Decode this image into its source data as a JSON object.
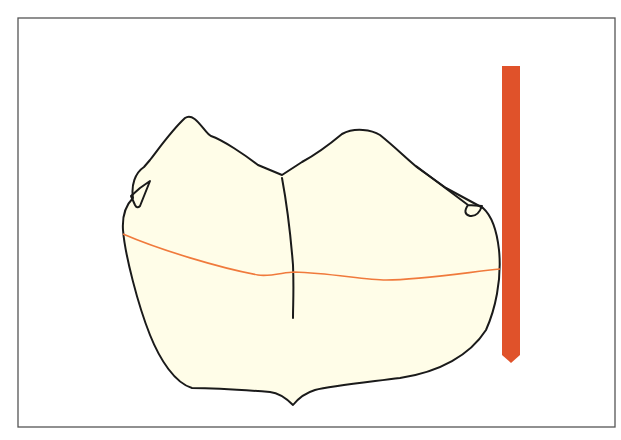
{
  "diagram": {
    "elements": [
      {
        "id": "tooth-crown",
        "type": "outline-shape"
      },
      {
        "id": "central-groove",
        "type": "line"
      },
      {
        "id": "survey-line",
        "type": "curve"
      },
      {
        "id": "analyzing-rod",
        "type": "vertical-bar"
      }
    ]
  },
  "colors": {
    "background": "#ffffff",
    "border": "#555555",
    "tooth_fill": "#fffde8",
    "tooth_outline": "#1a1a1a",
    "survey_line": "#f07a3c",
    "analyzing_rod": "#e0522a"
  }
}
